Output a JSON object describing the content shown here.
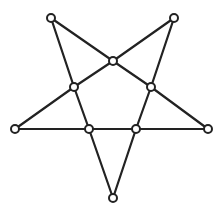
{
  "diagram": {
    "type": "graph",
    "colors": {
      "edge": "#222222",
      "node_fill": "#ffffff",
      "node_stroke": "#222222",
      "background": "#ffffff"
    },
    "node_radius": 4,
    "nodes": [
      {
        "id": "tip-top-left",
        "x": 51,
        "y": 18
      },
      {
        "id": "tip-top-right",
        "x": 174,
        "y": 18
      },
      {
        "id": "tip-left",
        "x": 15,
        "y": 129
      },
      {
        "id": "tip-right",
        "x": 208,
        "y": 129
      },
      {
        "id": "tip-bottom",
        "x": 113,
        "y": 198
      },
      {
        "id": "inner-top",
        "x": 113,
        "y": 61
      },
      {
        "id": "inner-left",
        "x": 74,
        "y": 87
      },
      {
        "id": "inner-right",
        "x": 151,
        "y": 87
      },
      {
        "id": "inner-bottom-left",
        "x": 89,
        "y": 129
      },
      {
        "id": "inner-bottom-right",
        "x": 136,
        "y": 129
      }
    ],
    "edges": [
      [
        "tip-top-left",
        "inner-top"
      ],
      [
        "inner-top",
        "inner-right"
      ],
      [
        "inner-right",
        "tip-right"
      ],
      [
        "tip-top-right",
        "inner-top"
      ],
      [
        "inner-top",
        "inner-left"
      ],
      [
        "inner-left",
        "tip-left"
      ],
      [
        "tip-top-left",
        "inner-left"
      ],
      [
        "inner-left",
        "inner-bottom-left"
      ],
      [
        "inner-bottom-left",
        "tip-bottom"
      ],
      [
        "tip-top-right",
        "inner-right"
      ],
      [
        "inner-right",
        "inner-bottom-right"
      ],
      [
        "inner-bottom-right",
        "tip-bottom"
      ],
      [
        "tip-left",
        "inner-bottom-left"
      ],
      [
        "inner-bottom-left",
        "inner-bottom-right"
      ],
      [
        "inner-bottom-right",
        "tip-right"
      ]
    ]
  }
}
